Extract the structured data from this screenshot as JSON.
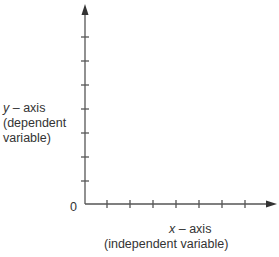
{
  "diagram": {
    "origin_label": "0",
    "y_axis": {
      "var": "y",
      "line1_suffix": " – axis",
      "line2": "(dependent",
      "line3": "variable)",
      "tick_count": 7
    },
    "x_axis": {
      "var": "x",
      "line1_suffix": " – axis",
      "line2": "(independent variable)",
      "tick_count": 7
    },
    "colors": {
      "axis": "#555555",
      "text": "#333333"
    }
  }
}
